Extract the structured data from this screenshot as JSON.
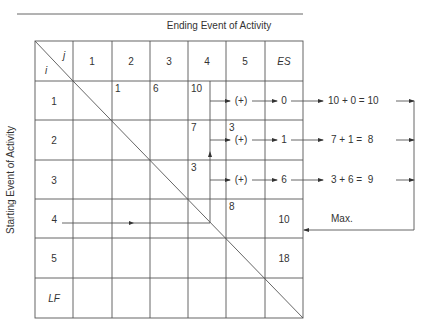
{
  "titles": {
    "top_label": "Ending Event of Activity",
    "left_label": "Starting Event of Activity"
  },
  "corner": {
    "col_symbol": "j",
    "row_symbol": "i"
  },
  "column_headers": [
    "1",
    "2",
    "3",
    "4",
    "5",
    "ES"
  ],
  "row_headers": [
    "1",
    "2",
    "3",
    "4",
    "5",
    "LF"
  ],
  "cells": {
    "r1c2": "1",
    "r1c3": "6",
    "r1c4": "10",
    "r2c4": "7",
    "r2c5": "3",
    "r3c4": "3",
    "r4c5": "8",
    "r4es": "10",
    "r5es": "18"
  },
  "computations": [
    {
      "operator": "(+)",
      "es": "0",
      "expression": "10 + 0 = 10"
    },
    {
      "operator": "(+)",
      "es": "1",
      "expression": "7 + 1 =  8"
    },
    {
      "operator": "(+)",
      "es": "6",
      "expression": "3 + 6 =  9"
    }
  ],
  "max_label": "Max.",
  "row4_label": "4"
}
